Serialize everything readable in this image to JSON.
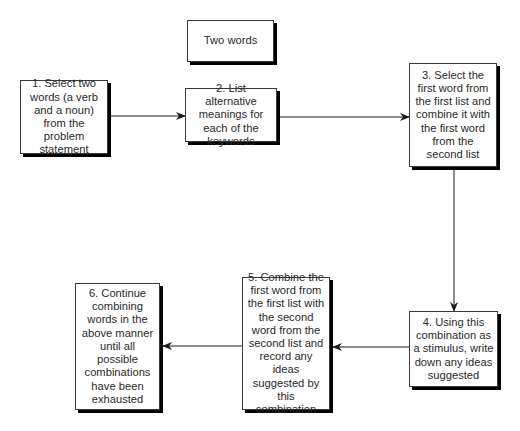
{
  "diagram": {
    "type": "flowchart",
    "label_box": {
      "text": "Two words"
    },
    "steps": [
      {
        "id": 1,
        "text": "1. Select two words (a verb and a noun) from the problem statement"
      },
      {
        "id": 2,
        "text": "2. List alternative meanings for each of the keywords"
      },
      {
        "id": 3,
        "text": "3. Select the first word from the first list and combine it with the first word from the second list"
      },
      {
        "id": 4,
        "text": "4. Using this combination as a stimulus, write down any ideas suggested"
      },
      {
        "id": 5,
        "text": "5. Combine the first word from the first list with the second word from the second list and record any ideas suggested by this combination"
      },
      {
        "id": 6,
        "text": "6. Continue combining words in the above manner until all possible combinations have been exhausted"
      }
    ],
    "edges": [
      {
        "from": 1,
        "to": 2,
        "direction": "right"
      },
      {
        "from": 2,
        "to": 3,
        "direction": "right"
      },
      {
        "from": 3,
        "to": 4,
        "direction": "down"
      },
      {
        "from": 4,
        "to": 5,
        "direction": "left"
      },
      {
        "from": 5,
        "to": 6,
        "direction": "left"
      }
    ],
    "colors": {
      "box_border": "#3a3a3a",
      "box_shadow": "#000000",
      "arrow": "#1a1a1a",
      "text": "#2a2a2a"
    }
  }
}
